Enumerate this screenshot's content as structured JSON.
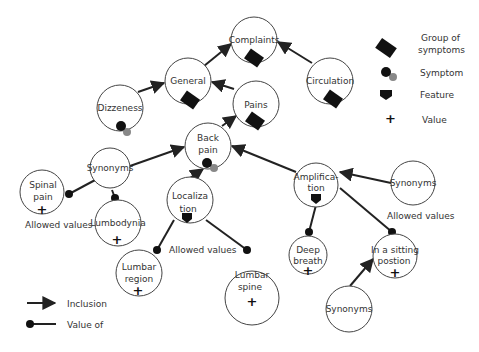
{
  "diagram": {
    "nodes": {
      "complaints": {
        "label1": "Complaints",
        "label2": ""
      },
      "general": {
        "label1": "General",
        "label2": ""
      },
      "circulation": {
        "label1": "Circulation",
        "label2": ""
      },
      "pains": {
        "label1": "Pains",
        "label2": ""
      },
      "dizzeness": {
        "label1": "Dizzeness",
        "label2": ""
      },
      "back_pain": {
        "label1": "Back",
        "label2": "pain"
      },
      "synonyms_left": {
        "label1": "Synonyms",
        "label2": ""
      },
      "spinal_pain": {
        "label1": "Spinal",
        "label2": "pain"
      },
      "lumbodynia": {
        "label1": "Lumbodynia",
        "label2": ""
      },
      "localization": {
        "label1": "Localiza",
        "label2": "tion"
      },
      "lumbar_region": {
        "label1": "Lumbar",
        "label2": "region"
      },
      "lumbar_spine": {
        "label1": "Lumbar",
        "label2": "spine"
      },
      "amplification": {
        "label1": "Amplifica-",
        "label2": "tion"
      },
      "synonyms_right": {
        "label1": "Synonyms",
        "label2": ""
      },
      "deep_breath": {
        "label1": "Deep",
        "label2": "breath"
      },
      "sitting_position": {
        "label1": "In a sitting",
        "label2": "postion"
      },
      "synonyms_bottom": {
        "label1": "Synonyms",
        "label2": ""
      }
    },
    "annotations": {
      "allowed_values_left": "Allowed values",
      "allowed_values_middle": "Allowed values",
      "allowed_values_right": "Allowed values"
    }
  },
  "legend": {
    "group_of_symptoms_line1": "Group of",
    "group_of_symptoms_line2": "symptoms",
    "symptom": "Symptom",
    "feature": "Feature",
    "value": "Value",
    "inclusion": "Inclusion",
    "value_of": "Value of"
  },
  "colors": {
    "stroke": "#222222",
    "symbol": "#111111",
    "symptom_secondary": "#888888",
    "text": "#333333"
  }
}
